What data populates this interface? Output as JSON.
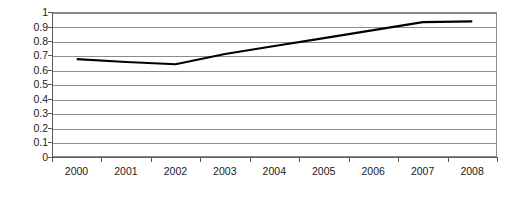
{
  "chart_data": {
    "type": "line",
    "title": "",
    "subtitle": "",
    "xlabel": "",
    "ylabel": "",
    "categories": [
      "2000",
      "2001",
      "2002",
      "2003",
      "2004",
      "2005",
      "2006",
      "2007",
      "2008"
    ],
    "series": [
      {
        "name": "",
        "values": [
          0.675,
          0.655,
          0.64,
          0.71,
          0.765,
          0.82,
          0.875,
          0.93,
          0.935
        ]
      }
    ],
    "ylim": [
      0,
      1
    ],
    "ytick_values": [
      0,
      0.1,
      0.2,
      0.3,
      0.4,
      0.5,
      0.6,
      0.7,
      0.8,
      0.9,
      1
    ],
    "ytick_labels": [
      "0",
      "0.1",
      "0.2",
      "0.3",
      "0.4",
      "0.5",
      "0.6",
      "0.7",
      "0.8",
      "0.9",
      "1"
    ],
    "grid": true,
    "grid_axis": "y",
    "legend": false,
    "legend_position": "none",
    "annotations": []
  },
  "style": {
    "background_color": "#ffffff",
    "gridline_color": "#8c8c8c",
    "axis_color": "#595959",
    "series_color": "#000000",
    "label_color": "#1a1a1a"
  }
}
